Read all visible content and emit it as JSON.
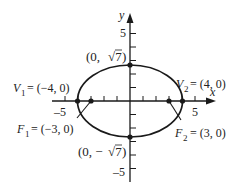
{
  "diagram": {
    "type": "ellipse",
    "equation_hint": "x^2/16 + y^2/7 = 1",
    "axes": {
      "x_label": "x",
      "y_label": "y",
      "x_ticks_labeled": [
        "-5",
        "5"
      ],
      "y_ticks_labeled": [
        "5",
        "-5"
      ],
      "x_range": [
        -5,
        5
      ],
      "y_range": [
        -5,
        5
      ]
    },
    "points": [
      {
        "id": "V1",
        "name": "V",
        "sub": "1",
        "coords": "= (−4, 0)",
        "x": -4,
        "y": 0
      },
      {
        "id": "V2",
        "name": "V",
        "sub": "2",
        "coords": "= (4, 0)",
        "x": 4,
        "y": 0
      },
      {
        "id": "F1",
        "name": "F",
        "sub": "1",
        "coords": "= (−3, 0)",
        "x": -3,
        "y": 0
      },
      {
        "id": "F2",
        "name": "F",
        "sub": "2",
        "coords": "= (3, 0)",
        "x": 3,
        "y": 0
      },
      {
        "id": "top",
        "label": "(0, √7)",
        "x": 0,
        "y": 2.6458
      },
      {
        "id": "bottom",
        "label": "(0, −√7)",
        "x": 0,
        "y": -2.6458
      }
    ],
    "labels": {
      "v1_name": "V",
      "v1_sub": "1",
      "v1_coords": "= (−4, 0)",
      "v2_name": "V",
      "v2_sub": "2",
      "v2_coords": "= (4, 0)",
      "f1_name": "F",
      "f1_sub": "1",
      "f1_coords": "= (−3, 0)",
      "f2_name": "F",
      "f2_sub": "2",
      "f2_coords": "= (3, 0)",
      "top_open": "(0, ",
      "top_root": "√7",
      "top_close": ")",
      "bottom_open": "(0, −",
      "bottom_root": "√7",
      "bottom_close": ")",
      "x_tick_neg": "–5",
      "x_tick_pos": "5",
      "y_tick_pos": "5",
      "y_tick_neg": "–5",
      "x_axis": "x",
      "y_axis": "y"
    },
    "colors": {
      "stroke": "#1a1a1a",
      "background": "#ffffff"
    }
  }
}
